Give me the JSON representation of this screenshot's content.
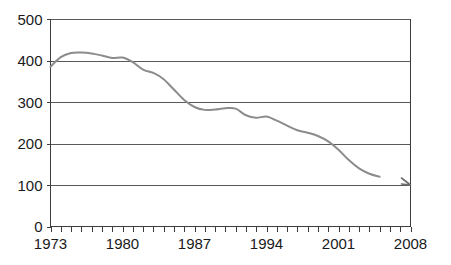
{
  "chart_data": {
    "type": "line",
    "title": "",
    "subtitle": "",
    "xlabel": "",
    "ylabel": "",
    "xlim": [
      1973,
      2008
    ],
    "ylim": [
      0,
      500
    ],
    "yticks": [
      0,
      100,
      200,
      300,
      400,
      500
    ],
    "ytick_labels": [
      "0",
      "100",
      "200",
      "300",
      "400",
      "500"
    ],
    "xticks": [
      1973,
      1980,
      1987,
      1994,
      2001,
      2008
    ],
    "xtick_labels": [
      "1973",
      "1980",
      "1987",
      "1994",
      "2001",
      "2008"
    ],
    "minor_xticks_every": 1,
    "grid": "horizontal",
    "legend": "none",
    "line_color": "#8c8c8c",
    "grid_color": "#595959",
    "axis_color": "#3d3d3d",
    "background_color": "#ffffff",
    "series": [
      {
        "name": "series-1",
        "x": [
          1973,
          1974,
          1975,
          1976,
          1977,
          1978,
          1979,
          1980,
          1981,
          1982,
          1983,
          1984,
          1985,
          1986,
          1987,
          1988,
          1989,
          1990,
          1991,
          1992,
          1993,
          1994,
          1995,
          1996,
          1997,
          1998,
          1999,
          2000,
          2001,
          2002,
          2003,
          2004,
          2005,
          2008
        ],
        "y": [
          385,
          408,
          418,
          419,
          417,
          412,
          406,
          407,
          396,
          378,
          370,
          355,
          330,
          305,
          288,
          281,
          282,
          285,
          284,
          268,
          262,
          265,
          255,
          243,
          232,
          226,
          218,
          205,
          185,
          160,
          140,
          127,
          120,
          100
        ],
        "values_note": "read from gridline positions at 100-unit intervals"
      }
    ],
    "annotations": [
      {
        "type": "end-point-marker",
        "x": 2008,
        "y": 100
      }
    ]
  },
  "axis_labels": {
    "y": [
      "0",
      "100",
      "200",
      "300",
      "400",
      "500"
    ],
    "x": [
      "1973",
      "1980",
      "1987",
      "1994",
      "2001",
      "2008"
    ]
  }
}
